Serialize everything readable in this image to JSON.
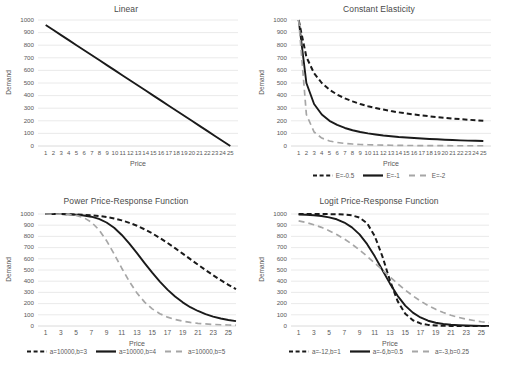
{
  "chart_data": [
    {
      "type": "line",
      "title": "Linear",
      "xlabel": "Price",
      "ylabel": "Demand",
      "xlim": [
        0,
        26
      ],
      "ylim": [
        0,
        1000
      ],
      "yticks": [
        0,
        100,
        200,
        300,
        400,
        500,
        600,
        700,
        800,
        900,
        1000
      ],
      "xticks": [
        1,
        2,
        3,
        4,
        5,
        6,
        7,
        8,
        9,
        10,
        11,
        12,
        13,
        14,
        15,
        16,
        17,
        18,
        19,
        20,
        21,
        22,
        23,
        24,
        25
      ],
      "grid": true,
      "legend": null,
      "series": [
        {
          "name": "d(p) = 1000 - 40p",
          "style": "solid",
          "color": "#1a1a1a",
          "x": [
            1,
            2,
            3,
            4,
            5,
            6,
            7,
            8,
            9,
            10,
            11,
            12,
            13,
            14,
            15,
            16,
            17,
            18,
            19,
            20,
            21,
            22,
            23,
            24,
            25
          ],
          "values": [
            960,
            920,
            880,
            840,
            800,
            760,
            720,
            680,
            640,
            600,
            560,
            520,
            480,
            440,
            400,
            360,
            320,
            280,
            240,
            200,
            160,
            120,
            80,
            40,
            0
          ]
        }
      ]
    },
    {
      "type": "line",
      "title": "Constant Elasticity",
      "xlabel": "Price",
      "ylabel": "Demand",
      "xlim": [
        0,
        26
      ],
      "ylim": [
        0,
        1000
      ],
      "yticks": [
        0,
        100,
        200,
        300,
        400,
        500,
        600,
        700,
        800,
        900,
        1000
      ],
      "xticks": [
        1,
        2,
        3,
        4,
        5,
        6,
        7,
        8,
        9,
        10,
        11,
        12,
        13,
        14,
        15,
        16,
        17,
        18,
        19,
        20,
        21,
        22,
        23,
        24,
        25
      ],
      "grid": true,
      "legend": {
        "position": "bottom"
      },
      "series": [
        {
          "name": "E=-0.5",
          "style": "dashed",
          "color": "#1a1a1a",
          "x": [
            1,
            2,
            3,
            4,
            5,
            6,
            7,
            8,
            9,
            10,
            11,
            12,
            13,
            14,
            15,
            16,
            17,
            18,
            19,
            20,
            21,
            22,
            23,
            24,
            25
          ],
          "values": [
            1000,
            707,
            577,
            500,
            447,
            408,
            378,
            354,
            333,
            316,
            302,
            289,
            277,
            267,
            258,
            250,
            243,
            236,
            229,
            224,
            218,
            213,
            209,
            204,
            200
          ]
        },
        {
          "name": "E=-1",
          "style": "solid",
          "color": "#1a1a1a",
          "x": [
            1,
            2,
            3,
            4,
            5,
            6,
            7,
            8,
            9,
            10,
            11,
            12,
            13,
            14,
            15,
            16,
            17,
            18,
            19,
            20,
            21,
            22,
            23,
            24,
            25
          ],
          "values": [
            1000,
            500,
            333,
            250,
            200,
            167,
            143,
            125,
            111,
            100,
            91,
            83,
            77,
            71,
            67,
            63,
            59,
            56,
            53,
            50,
            48,
            45,
            43,
            42,
            40
          ]
        },
        {
          "name": "E=-2",
          "style": "dashed",
          "color": "#a6a6a6",
          "x": [
            1,
            2,
            3,
            4,
            5,
            6,
            7,
            8,
            9,
            10,
            11,
            12,
            13,
            14,
            15,
            16,
            17,
            18,
            19,
            20,
            21,
            22,
            23,
            24,
            25
          ],
          "values": [
            1000,
            250,
            111,
            63,
            40,
            28,
            20,
            16,
            12,
            10,
            8,
            7,
            6,
            5,
            4,
            4,
            3,
            3,
            3,
            3,
            2,
            2,
            2,
            2,
            2
          ]
        }
      ]
    },
    {
      "type": "line",
      "title": "Power Price-Response Function",
      "xlabel": "Price",
      "ylabel": "Demand",
      "xlim": [
        0,
        26
      ],
      "ylim": [
        0,
        1000
      ],
      "yticks": [
        0,
        100,
        200,
        300,
        400,
        500,
        600,
        700,
        800,
        900,
        1000
      ],
      "xticks": [
        1,
        3,
        5,
        7,
        9,
        11,
        13,
        15,
        17,
        19,
        21,
        23,
        25
      ],
      "grid": true,
      "legend": {
        "position": "bottom"
      },
      "series": [
        {
          "name": "a=10000,b=3",
          "style": "dashed",
          "color": "#1a1a1a",
          "x": [
            1,
            2,
            3,
            4,
            5,
            6,
            7,
            8,
            9,
            10,
            11,
            12,
            13,
            14,
            15,
            16,
            17,
            18,
            19,
            20,
            21,
            22,
            23,
            24,
            25,
            26
          ],
          "values": [
            1000,
            999,
            999,
            998,
            996,
            993,
            989,
            982,
            973,
            960,
            943,
            921,
            895,
            863,
            827,
            786,
            742,
            695,
            646,
            597,
            548,
            500,
            453,
            409,
            368,
            329
          ]
        },
        {
          "name": "a=10000,b=4",
          "style": "solid",
          "color": "#1a1a1a",
          "x": [
            1,
            2,
            3,
            4,
            5,
            6,
            7,
            8,
            9,
            10,
            11,
            12,
            13,
            14,
            15,
            16,
            17,
            18,
            19,
            20,
            21,
            22,
            23,
            24,
            25,
            26
          ],
          "values": [
            1000,
            999,
            999,
            997,
            994,
            987,
            976,
            956,
            924,
            877,
            813,
            736,
            651,
            562,
            477,
            396,
            325,
            263,
            211,
            168,
            134,
            106,
            84,
            67,
            54,
            43
          ]
        },
        {
          "name": "a=10000,b=5",
          "style": "dashed",
          "color": "#a6a6a6",
          "x": [
            1,
            2,
            3,
            4,
            5,
            6,
            7,
            8,
            9,
            10,
            11,
            12,
            13,
            14,
            15,
            16,
            17,
            18,
            19,
            20,
            21,
            22,
            23,
            24,
            25,
            26
          ],
          "values": [
            1000,
            999,
            998,
            996,
            988,
            968,
            928,
            859,
            762,
            643,
            516,
            397,
            294,
            213,
            153,
            110,
            79,
            58,
            43,
            32,
            24,
            19,
            14,
            11,
            9,
            7
          ]
        }
      ]
    },
    {
      "type": "line",
      "title": "Logit Price-Response Function",
      "xlabel": "Price",
      "ylabel": "Demand",
      "xlim": [
        0,
        26
      ],
      "ylim": [
        0,
        1000
      ],
      "yticks": [
        0,
        100,
        200,
        300,
        400,
        500,
        600,
        700,
        800,
        900,
        1000
      ],
      "xticks": [
        1,
        3,
        5,
        7,
        9,
        11,
        13,
        15,
        17,
        19,
        21,
        23,
        25
      ],
      "grid": true,
      "legend": {
        "position": "bottom"
      },
      "series": [
        {
          "name": "a=-12,b=1",
          "style": "dashed",
          "color": "#1a1a1a",
          "x": [
            1,
            2,
            3,
            4,
            5,
            6,
            7,
            8,
            9,
            10,
            11,
            12,
            13,
            14,
            15,
            16,
            17,
            18,
            19,
            20,
            21,
            22,
            23,
            24,
            25,
            26
          ],
          "values": [
            1000,
            1000,
            1000,
            1000,
            999,
            998,
            995,
            988,
            968,
            917,
            802,
            622,
            405,
            222,
            110,
            51,
            23,
            10,
            5,
            2,
            1,
            0,
            0,
            0,
            0,
            0
          ]
        },
        {
          "name": "a=-6,b=0.5",
          "style": "solid",
          "color": "#1a1a1a",
          "x": [
            1,
            2,
            3,
            4,
            5,
            6,
            7,
            8,
            9,
            10,
            11,
            12,
            13,
            14,
            15,
            16,
            17,
            18,
            19,
            20,
            21,
            22,
            23,
            24,
            25,
            26
          ],
          "values": [
            996,
            993,
            989,
            982,
            970,
            953,
            924,
            881,
            818,
            731,
            622,
            500,
            378,
            269,
            182,
            119,
            76,
            47,
            29,
            18,
            11,
            7,
            4,
            2,
            1,
            1
          ]
        },
        {
          "name": "a=-3,b=0.25",
          "style": "dashed",
          "color": "#a6a6a6",
          "x": [
            1,
            2,
            3,
            4,
            5,
            6,
            7,
            8,
            9,
            10,
            11,
            12,
            13,
            14,
            15,
            16,
            17,
            18,
            19,
            20,
            21,
            22,
            23,
            24,
            25,
            26
          ],
          "values": [
            939,
            924,
            904,
            881,
            851,
            817,
            777,
            731,
            679,
            622,
            562,
            500,
            438,
            378,
            321,
            269,
            223,
            183,
            149,
            120,
            96,
            77,
            61,
            49,
            38,
            30
          ]
        }
      ]
    }
  ],
  "colors": {
    "dark_line": "#1a1a1a",
    "gray_line": "#a6a6a6",
    "grid": "#d9d9d9",
    "axis": "#d0d0d0",
    "text": "#595959",
    "title": "#4a4a4a",
    "background": "#ffffff"
  }
}
